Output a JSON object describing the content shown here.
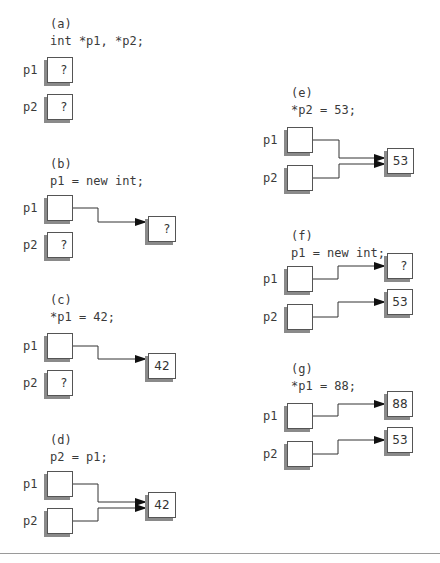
{
  "panels": [
    {
      "id": "a",
      "label": "(a)",
      "code": "int *p1, *p2;",
      "vars": [
        "p1",
        "p2"
      ],
      "p1_value": "?",
      "p2_value": "?",
      "targets": []
    },
    {
      "id": "b",
      "label": "(b)",
      "code": "p1 = new int;",
      "vars": [
        "p1",
        "p2"
      ],
      "p1_value": "",
      "p2_value": "?",
      "targets": [
        "?"
      ]
    },
    {
      "id": "c",
      "label": "(c)",
      "code": "*p1 = 42;",
      "vars": [
        "p1",
        "p2"
      ],
      "p1_value": "",
      "p2_value": "?",
      "targets": [
        "42"
      ]
    },
    {
      "id": "d",
      "label": "(d)",
      "code": "p2 = p1;",
      "vars": [
        "p1",
        "p2"
      ],
      "p1_value": "",
      "p2_value": "",
      "targets": [
        "42"
      ]
    },
    {
      "id": "e",
      "label": "(e)",
      "code": "*p2 = 53;",
      "vars": [
        "p1",
        "p2"
      ],
      "p1_value": "",
      "p2_value": "",
      "targets": [
        "53"
      ]
    },
    {
      "id": "f",
      "label": "(f)",
      "code": "p1 = new int;",
      "vars": [
        "p1",
        "p2"
      ],
      "p1_value": "",
      "p2_value": "",
      "targets": [
        "?",
        "53"
      ]
    },
    {
      "id": "g",
      "label": "(g)",
      "code": "*p1 = 88;",
      "vars": [
        "p1",
        "p2"
      ],
      "p1_value": "",
      "p2_value": "",
      "targets": [
        "88",
        "53"
      ]
    }
  ],
  "colors": {
    "box_border": "#555555",
    "shadow": "#8a8a8a",
    "wire": "#333333",
    "rule": "#9a9a9a"
  }
}
